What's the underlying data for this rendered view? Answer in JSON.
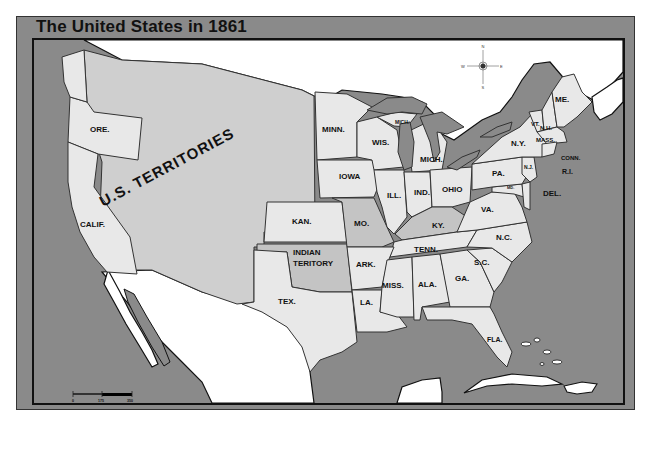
{
  "title": "The United States in 1861",
  "compass": {
    "n": "N",
    "s": "S",
    "e": "E",
    "w": "W",
    "icon": "compass-rose-icon"
  },
  "scale_bar": {
    "ticks": [
      "0",
      "175",
      "350"
    ]
  },
  "territory_label": "U.S. TERRITORIES",
  "states": {
    "ore": "ORE.",
    "calif": "CALIF.",
    "minn": "MINN.",
    "wis": "WIS.",
    "mich_up": "MICH.",
    "mich": "MICH.",
    "iowa": "IOWA",
    "ill": "ILL.",
    "ind": "IND.",
    "ohio": "OHIO",
    "kan": "KAN.",
    "mo": "MO.",
    "ky": "KY.",
    "indian_territory_1": "INDIAN",
    "indian_territory_2": "TERITORY",
    "ark": "ARK.",
    "tenn": "TENN.",
    "tex": "TEX.",
    "la": "LA.",
    "miss": "MISS.",
    "ala": "ALA.",
    "ga": "GA.",
    "sc": "S.C.",
    "nc": "N.C.",
    "va": "VA.",
    "pa": "PA.",
    "ny": "N.Y.",
    "nj": "N.J.",
    "md": "MD.",
    "del": "DEL.",
    "conn": "CONN.",
    "ri": "R.I.",
    "mass": "MASS.",
    "vt": "VT.",
    "nh": "N.H.",
    "me": "ME.",
    "fla": "FLA."
  },
  "colors": {
    "water": "#8a8a8a",
    "foreign_land": "#ffffff",
    "union_state": "#e8e8e8",
    "territory": "#cfcfcf",
    "border_state": "#c4c4c4"
  }
}
